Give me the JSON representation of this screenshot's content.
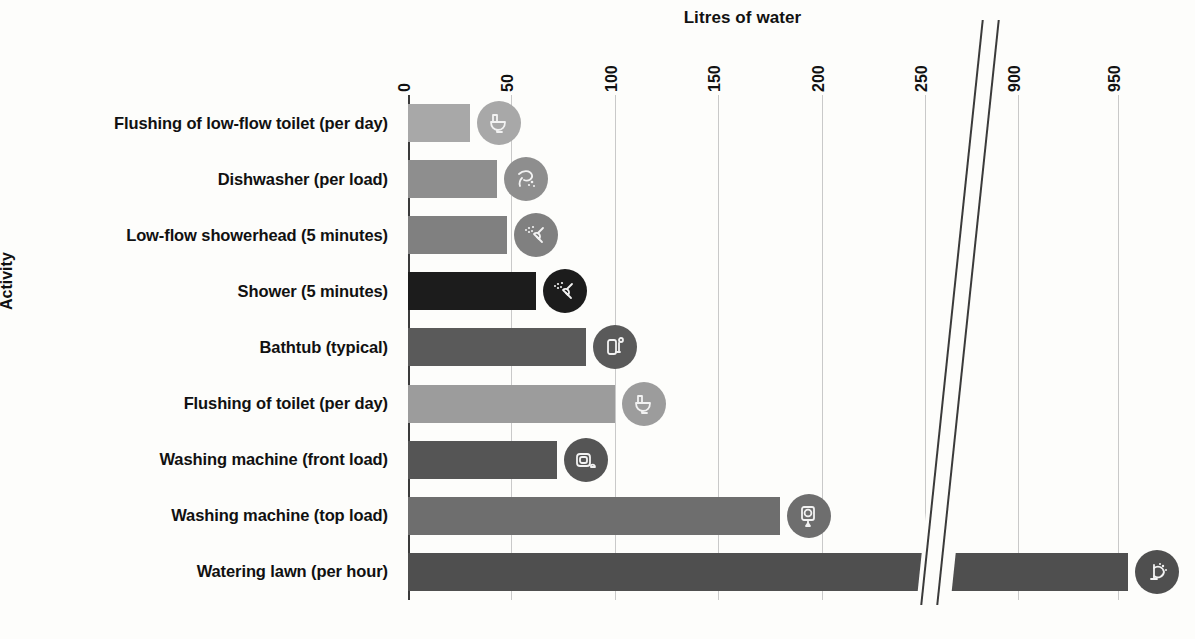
{
  "chart_data": {
    "type": "bar",
    "orientation": "horizontal",
    "title": "Litres of water",
    "xlabel": "Litres of water",
    "ylabel": "Activity",
    "grid": true,
    "legend": "none",
    "axis_break": {
      "after": 250,
      "resume": 900
    },
    "xticks": [
      0,
      50,
      100,
      150,
      200,
      250,
      900,
      950
    ],
    "xtick_labels": [
      "0",
      "50",
      "100",
      "150",
      "200",
      "250",
      "900",
      "950"
    ],
    "xlim": [
      0,
      975
    ],
    "categories": [
      "Flushing of low-flow toilet (per day)",
      "Dishwasher (per load)",
      "Low-flow showerhead (5 minutes)",
      "Shower (5 minutes)",
      "Bathtub (typical)",
      "Flushing of toilet (per day)",
      "Washing machine (front load)",
      "Washing machine (top load)",
      "Watering lawn (per hour)"
    ],
    "values": [
      30,
      43,
      48,
      62,
      86,
      100,
      72,
      180,
      955
    ],
    "bar_colors": [
      "#a8a8a8",
      "#8e8e8e",
      "#808080",
      "#1c1c1c",
      "#5a5a5a",
      "#9c9c9c",
      "#555555",
      "#6e6e6e",
      "#4f4f4f"
    ],
    "icons": [
      "toilet-icon",
      "dishwasher-icon",
      "showerhead-icon",
      "shower-icon",
      "bathtub-icon",
      "toilet-icon",
      "washing-machine-front-icon",
      "washing-machine-top-icon",
      "sprinkler-icon"
    ]
  },
  "colors": {
    "background": "#fdfdfb",
    "axis": "#3a3a3a",
    "gridline": "#c9c9c9",
    "text": "#111111"
  }
}
